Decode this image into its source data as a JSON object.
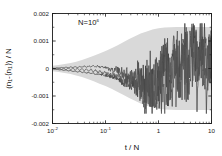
{
  "chart_data": {
    "type": "line",
    "title": "",
    "annotation": "N=10",
    "annotation_exponent": "6",
    "annotation_full": "N=10^6",
    "xlabel": "t / N",
    "ylabel": "(n₁-⟨n₁⟩) / N",
    "xscale": "log",
    "yscale": "linear",
    "xlim": [
      0.01,
      10
    ],
    "ylim": [
      -0.002,
      0.002
    ],
    "grid": false,
    "legend": "none",
    "xticks": [
      0.01,
      0.1,
      1,
      10
    ],
    "xticklabels": [
      "10⁻²",
      "10⁻¹",
      "1",
      "10"
    ],
    "xtick_mantissa": [
      "10",
      "10",
      "1",
      "10"
    ],
    "xtick_exponent": [
      "-2",
      "-1",
      "",
      ""
    ],
    "yticks": [
      0.002,
      0.001,
      0,
      -0.001,
      -0.002
    ],
    "yticklabels": [
      "0.002",
      "0.001",
      "0",
      "-0.001",
      "-0.002"
    ],
    "band": {
      "name": "standard deviation envelope",
      "color": "#d9d9d9",
      "x": [
        0.01,
        0.013,
        0.017,
        0.022,
        0.028,
        0.036,
        0.046,
        0.06,
        0.077,
        0.1,
        0.13,
        0.17,
        0.22,
        0.28,
        0.36,
        0.46,
        0.6,
        0.77,
        1.0,
        1.3,
        1.7,
        2.2,
        2.8,
        3.6,
        4.6,
        6.0,
        7.7,
        10.0
      ],
      "upper": [
        0.0001,
        0.00013,
        0.00016,
        0.0002,
        0.00025,
        0.00031,
        0.00038,
        0.00046,
        0.00055,
        0.00064,
        0.00074,
        0.00085,
        0.00096,
        0.00107,
        0.00117,
        0.00127,
        0.00135,
        0.00142,
        0.00146,
        0.00149,
        0.0015,
        0.00151,
        0.00151,
        0.00151,
        0.00151,
        0.00151,
        0.00151,
        0.00151
      ],
      "lower": [
        -0.0001,
        -0.00013,
        -0.00016,
        -0.0002,
        -0.00025,
        -0.00031,
        -0.00038,
        -0.00046,
        -0.00055,
        -0.00064,
        -0.00074,
        -0.00085,
        -0.00096,
        -0.00107,
        -0.00117,
        -0.00127,
        -0.00135,
        -0.00142,
        -0.00146,
        -0.00149,
        -0.0015,
        -0.00151,
        -0.00151,
        -0.00151,
        -0.00151,
        -0.00151,
        -0.00151,
        -0.00151
      ]
    },
    "series": [
      {
        "name": "trajectory 1",
        "color": "#3a3a3a",
        "x": [
          0.01,
          0.011,
          0.0121,
          0.0134,
          0.0148,
          0.0163,
          0.018,
          0.0199,
          0.022,
          0.0242,
          0.0268,
          0.0295,
          0.0326,
          0.036,
          0.0397,
          0.0438,
          0.0484,
          0.0534,
          0.059,
          0.0651,
          0.0718,
          0.0793,
          0.0875,
          0.0966,
          0.1066,
          0.1177,
          0.1299,
          0.1434,
          0.1583,
          0.1747,
          0.1928,
          0.2128,
          0.2349,
          0.2593,
          0.2862,
          0.3159,
          0.3487,
          0.3849,
          0.4249,
          0.469,
          0.5177,
          0.5714,
          0.6307,
          0.6962,
          0.7685,
          0.8482,
          0.9363,
          1.0335,
          1.1408,
          1.2592,
          1.3899,
          1.5342,
          1.6935,
          1.8693,
          2.0633,
          2.2775,
          2.5139,
          2.7749,
          3.063,
          3.381,
          3.732,
          4.1195,
          4.5473,
          5.0195,
          5.5408,
          6.1163,
          6.7515,
          7.4527,
          8.2268,
          9.0812,
          10.0
        ],
        "y": [
          -1e-05,
          -3e-05,
          -2e-05,
          -5e-05,
          -4e-05,
          -7e-05,
          -5e-05,
          -9e-05,
          -7e-05,
          -0.00011,
          -9e-05,
          -0.00013,
          -0.0001,
          -0.00015,
          -0.00012,
          -0.00017,
          -0.00014,
          -0.00019,
          -0.00016,
          -0.00022,
          -0.00018,
          -0.00024,
          -0.00021,
          -0.00028,
          -0.00025,
          -0.00033,
          -0.00029,
          -0.00038,
          -0.00034,
          -0.00044,
          -0.0004,
          -0.00051,
          -0.00046,
          -0.00058,
          -0.00053,
          -0.00065,
          -0.0006,
          -0.00072,
          -0.00067,
          -0.00079,
          -0.00073,
          -0.00086,
          -0.0008,
          -0.00092,
          -0.00088,
          -0.0008,
          -0.00061,
          -0.0003,
          -4e-05,
          0.00014,
          2e-05,
          -0.00025,
          -8e-05,
          0.0003,
          0.00058,
          0.00032,
          5e-05,
          0.00038,
          0.00072,
          0.0004,
          8e-05,
          0.00045,
          0.0008,
          0.00046,
          0.00012,
          0.00052,
          0.00088,
          0.0005,
          0.00014,
          0.00056,
          0.00035
        ]
      },
      {
        "name": "trajectory 2",
        "color": "#4a4a4a",
        "x": [
          0.01,
          0.011,
          0.0121,
          0.0134,
          0.0148,
          0.0163,
          0.018,
          0.0199,
          0.022,
          0.0242,
          0.0268,
          0.0295,
          0.0326,
          0.036,
          0.0397,
          0.0438,
          0.0484,
          0.0534,
          0.059,
          0.0651,
          0.0718,
          0.0793,
          0.0875,
          0.0966,
          0.1066,
          0.1177,
          0.1299,
          0.1434,
          0.1583,
          0.1747,
          0.1928,
          0.2128,
          0.2349,
          0.2593,
          0.2862,
          0.3159,
          0.3487,
          0.3849,
          0.4249,
          0.469,
          0.5177,
          0.5714,
          0.6307,
          0.6962,
          0.7685,
          0.8482,
          0.9363,
          1.0335,
          1.1408,
          1.2592,
          1.3899,
          1.5342,
          1.6935,
          1.8693,
          2.0633,
          2.2775,
          2.5139,
          2.7749,
          3.063,
          3.381,
          3.732,
          4.1195,
          4.5473,
          5.0195,
          5.5408,
          6.1163,
          6.7515,
          7.4527,
          8.2268,
          9.0812,
          10.0
        ],
        "y": [
          2e-05,
          0.0,
          3e-05,
          1e-05,
          4e-05,
          2e-05,
          5e-05,
          2e-05,
          6e-05,
          3e-05,
          7e-05,
          3e-05,
          8e-05,
          4e-05,
          9e-05,
          4e-05,
          0.0001,
          5e-05,
          0.00011,
          5e-05,
          0.0001,
          3e-05,
          8e-05,
          0.0,
          5e-05,
          -4e-05,
          1e-05,
          -9e-05,
          -4e-05,
          -0.00014,
          -9e-05,
          -0.00019,
          -0.00014,
          -0.00024,
          -0.00019,
          -0.00029,
          -0.00024,
          -0.00034,
          -0.00029,
          -0.00039,
          -0.00034,
          -0.00043,
          -0.00038,
          -0.00047,
          -0.00042,
          -0.0005,
          -0.00045,
          -0.00052,
          -0.0003,
          -2e-05,
          0.00025,
          -0.0001,
          -0.00042,
          0.0,
          0.00035,
          -5e-05,
          -0.00048,
          5e-05,
          0.00045,
          -0.0001,
          -0.00055,
          0.0001,
          0.0006,
          -0.00015,
          -0.00065,
          0.00015,
          0.0007,
          -0.0002,
          -0.00075,
          0.0002,
          5e-05
        ]
      },
      {
        "name": "trajectory 3",
        "color": "#555555",
        "x": [
          0.01,
          0.011,
          0.0121,
          0.0134,
          0.0148,
          0.0163,
          0.018,
          0.0199,
          0.022,
          0.0242,
          0.0268,
          0.0295,
          0.0326,
          0.036,
          0.0397,
          0.0438,
          0.0484,
          0.0534,
          0.059,
          0.0651,
          0.0718,
          0.0793,
          0.0875,
          0.0966,
          0.1066,
          0.1177,
          0.1299,
          0.1434,
          0.1583,
          0.1747,
          0.1928,
          0.2128,
          0.2349,
          0.2593,
          0.2862,
          0.3159,
          0.3487,
          0.3849,
          0.4249,
          0.469,
          0.5177,
          0.5714,
          0.6307,
          0.6962,
          0.7685,
          0.8482,
          0.9363,
          1.0335,
          1.1408,
          1.2592,
          1.3899,
          1.5342,
          1.6935,
          1.8693,
          2.0633,
          2.2775,
          2.5139,
          2.7749,
          3.063,
          3.381,
          3.732,
          4.1195,
          4.5473,
          5.0195,
          5.5408,
          6.1163,
          6.7515,
          7.4527,
          8.2268,
          9.0812,
          10.0
        ],
        "y": [
          -2e-05,
          1e-05,
          -3e-05,
          2e-05,
          -4e-05,
          2e-05,
          -5e-05,
          3e-05,
          -6e-05,
          3e-05,
          -7e-05,
          2e-05,
          -8e-05,
          1e-05,
          -9e-05,
          0.0,
          -0.00011,
          -2e-05,
          -0.00013,
          -4e-05,
          -0.00016,
          -7e-05,
          -0.00019,
          -0.0001,
          -0.00023,
          -0.00014,
          -0.00027,
          -0.00018,
          -0.00032,
          -0.00023,
          -0.00038,
          -0.00029,
          -0.00045,
          -0.00036,
          -0.00053,
          -0.00044,
          -0.00062,
          -0.00053,
          -0.00071,
          -0.00062,
          -0.0008,
          -0.00071,
          -0.00088,
          -0.00079,
          -0.00093,
          -0.00085,
          -0.00078,
          -0.0005,
          -0.0007,
          -0.00035,
          -0.0006,
          -0.0002,
          -0.00055,
          5e-05,
          -0.0003,
          0.00025,
          -0.0002,
          0.0004,
          -0.00015,
          0.00055,
          -0.0001,
          0.00065,
          -0.00012,
          0.00075,
          -8e-05,
          0.00085,
          -5e-05,
          0.00095,
          0.0,
          0.0006,
          0.0003
        ]
      }
    ]
  }
}
